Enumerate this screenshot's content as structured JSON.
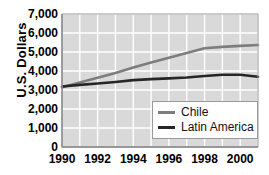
{
  "chart_data": {
    "type": "line",
    "title": "",
    "subtitle": "",
    "xlabel": "",
    "ylabel": "U.S. Dollars",
    "xlim": [
      1990,
      2001
    ],
    "ylim": [
      0,
      7000
    ],
    "grid": true,
    "legend_position": "bottom-right-inside",
    "y_ticks": [
      0,
      1000,
      2000,
      3000,
      4000,
      5000,
      6000,
      7000
    ],
    "y_tick_labels": [
      "0",
      "1,000",
      "2,000",
      "3,000",
      "4,000",
      "5,000",
      "6,000",
      "7,000"
    ],
    "x_ticks": [
      1990,
      1992,
      1994,
      1996,
      1998,
      2000
    ],
    "x_tick_labels": [
      "1990",
      "1992",
      "1994",
      "1996",
      "1998",
      "2000"
    ],
    "x_gridline_years": [
      1990,
      1991,
      1992,
      1993,
      1994,
      1995,
      1996,
      1997,
      1998,
      1999,
      2000,
      2001
    ],
    "x": [
      1990,
      1991,
      1992,
      1993,
      1994,
      1995,
      1996,
      1997,
      1998,
      1999,
      2000,
      2001
    ],
    "series": [
      {
        "name": "Chile",
        "color": "#7d7d7d",
        "values": [
          3150,
          3400,
          3650,
          3900,
          4180,
          4450,
          4700,
          4950,
          5200,
          5270,
          5320,
          5370
        ]
      },
      {
        "name": "Latin America",
        "color": "#262626",
        "values": [
          3180,
          3270,
          3340,
          3420,
          3520,
          3570,
          3610,
          3660,
          3740,
          3800,
          3800,
          3700
        ]
      }
    ]
  },
  "plot_style": {
    "plot_background": "#d9d9d9",
    "gridline_color": "#ffffff",
    "axis_color": "#9a9a9a",
    "page_background": "#ffffff"
  },
  "legend": {
    "entries": [
      {
        "label": "Chile",
        "color": "#7d7d7d"
      },
      {
        "label": "Latin America",
        "color": "#262626"
      }
    ]
  }
}
